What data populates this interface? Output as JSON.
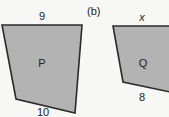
{
  "figure": {
    "part_b_label": "(b)",
    "shapes": [
      {
        "name": "P",
        "label": "P",
        "top_side": "9",
        "bottom_side": "10",
        "fill": "#b3b3b3",
        "stroke": "#2a2a2a"
      },
      {
        "name": "Q",
        "label": "Q",
        "top_side": "x",
        "bottom_side": "8",
        "fill": "#b3b3b3",
        "stroke": "#2a2a2a"
      }
    ]
  }
}
